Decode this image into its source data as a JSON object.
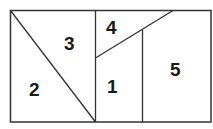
{
  "diagram": {
    "type": "partitioned-rectangle",
    "regions": [
      {
        "id": "1",
        "label": "1",
        "x": 107,
        "y": 77
      },
      {
        "id": "2",
        "label": "2",
        "x": 29,
        "y": 80
      },
      {
        "id": "3",
        "label": "3",
        "x": 64,
        "y": 34
      },
      {
        "id": "4",
        "label": "4",
        "x": 106,
        "y": 18
      },
      {
        "id": "5",
        "label": "5",
        "x": 170,
        "y": 60
      }
    ],
    "line_color": "#333333"
  }
}
